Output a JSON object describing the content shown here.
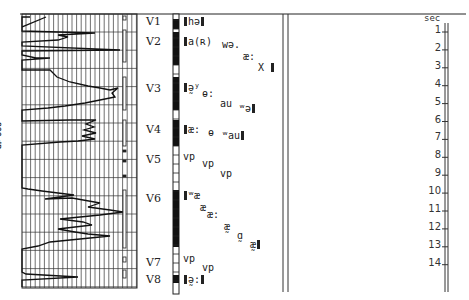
{
  "figure": {
    "axis_label": "800 dB",
    "time_unit_label": "sec",
    "time_ticks": [
      "1",
      "2",
      "3",
      "4",
      "5",
      "6",
      "7",
      "8",
      "9",
      "10",
      "11",
      "12",
      "13",
      "14"
    ],
    "segments": [
      {
        "label": "V1",
        "voiced": true
      },
      {
        "label": "V2",
        "voiced": true
      },
      {
        "label": "V3",
        "voiced": true
      },
      {
        "label": "V4",
        "voiced": true
      },
      {
        "label": "V5",
        "voiced": false
      },
      {
        "label": "V6",
        "voiced": true
      },
      {
        "label": "V7",
        "voiced": false
      },
      {
        "label": "V8",
        "voiced": true
      }
    ],
    "transcription": [
      {
        "segment": "V1",
        "tokens": [
          "hə"
        ]
      },
      {
        "segment": "V2",
        "tokens": [
          "a(ʀ)",
          "wə.",
          "æ:",
          "X"
        ]
      },
      {
        "segment": "V3",
        "tokens": [
          "ə̰ʸ",
          "ɵ:",
          "au",
          "ʷə"
        ]
      },
      {
        "segment": "V4",
        "tokens": [
          "æ:",
          "ɵ",
          "ʷau"
        ]
      },
      {
        "segment": "V5",
        "tokens": [
          "vp",
          "vp",
          "vp"
        ]
      },
      {
        "segment": "V6",
        "tokens": [
          "ʷæ",
          "æ",
          "æ:",
          "æ̰",
          "ɑ̰",
          "æ̰"
        ]
      },
      {
        "segment": "V7",
        "tokens": [
          "vp",
          "vp"
        ]
      },
      {
        "segment": "V8",
        "tokens": [
          "ə̰:"
        ]
      }
    ]
  }
}
